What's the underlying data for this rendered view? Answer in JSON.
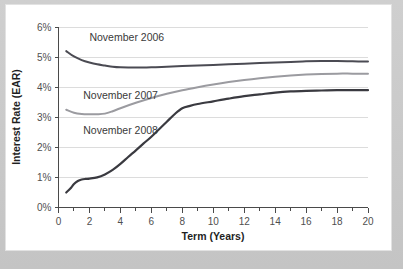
{
  "chart_data": {
    "type": "line",
    "title": "",
    "xlabel": "Term (Years)",
    "ylabel": "Interest Rate (EAR)",
    "xlim": [
      0,
      20
    ],
    "ylim": [
      0,
      6
    ],
    "grid": true,
    "legend_position": "inline-annotations",
    "x_ticks": [
      0,
      2,
      4,
      6,
      8,
      10,
      12,
      14,
      16,
      18,
      20
    ],
    "x_tick_labels": [
      "0",
      "2",
      "4",
      "6",
      "8",
      "10",
      "12",
      "14",
      "16",
      "18",
      "20"
    ],
    "x_minor_tick_step": 1,
    "y_ticks": [
      0,
      1,
      2,
      3,
      4,
      5,
      6
    ],
    "y_tick_labels": [
      "0%",
      "1%",
      "2%",
      "3%",
      "4%",
      "5%",
      "6%"
    ],
    "series": [
      {
        "name": "November 2006",
        "color": "#4b4b53",
        "stroke_width": 2.0,
        "label_x": 2.0,
        "label_y": 5.55,
        "x": [
          0.5,
          1,
          1.5,
          2,
          2.5,
          3,
          3.5,
          4,
          5,
          6,
          7,
          8,
          9,
          10,
          11,
          12,
          13,
          14,
          15,
          16,
          17,
          18,
          19,
          20
        ],
        "values": [
          5.2,
          5.02,
          4.9,
          4.82,
          4.76,
          4.72,
          4.68,
          4.66,
          4.65,
          4.66,
          4.68,
          4.7,
          4.72,
          4.74,
          4.76,
          4.78,
          4.8,
          4.82,
          4.84,
          4.86,
          4.87,
          4.87,
          4.86,
          4.85
        ]
      },
      {
        "name": "November 2007",
        "color": "#9b9ba0",
        "stroke_width": 2.0,
        "label_x": 1.6,
        "label_y": 3.62,
        "x": [
          0.5,
          1,
          1.5,
          2,
          2.5,
          3,
          3.5,
          4,
          5,
          6,
          7,
          8,
          9,
          10,
          11,
          12,
          13,
          14,
          15,
          16,
          17,
          18,
          19,
          20
        ],
        "values": [
          3.25,
          3.15,
          3.11,
          3.1,
          3.1,
          3.12,
          3.2,
          3.3,
          3.48,
          3.64,
          3.78,
          3.9,
          4.0,
          4.09,
          4.17,
          4.24,
          4.3,
          4.35,
          4.39,
          4.42,
          4.44,
          4.45,
          4.45,
          4.45
        ]
      },
      {
        "name": "November 2008",
        "color": "#3a3a40",
        "stroke_width": 2.2,
        "label_x": 1.6,
        "label_y": 2.45,
        "x": [
          0.5,
          0.75,
          1,
          1.25,
          1.5,
          1.75,
          2,
          2.5,
          3,
          3.5,
          4,
          4.5,
          5,
          5.5,
          6,
          6.5,
          7,
          7.5,
          8,
          8.5,
          9,
          10,
          11,
          12,
          13,
          14,
          15,
          16,
          17,
          18,
          19,
          20
        ],
        "values": [
          0.5,
          0.62,
          0.78,
          0.88,
          0.93,
          0.95,
          0.96,
          1.0,
          1.1,
          1.25,
          1.45,
          1.68,
          1.9,
          2.13,
          2.35,
          2.6,
          2.85,
          3.1,
          3.3,
          3.38,
          3.44,
          3.53,
          3.62,
          3.7,
          3.76,
          3.82,
          3.86,
          3.88,
          3.89,
          3.9,
          3.9,
          3.9
        ]
      }
    ]
  }
}
